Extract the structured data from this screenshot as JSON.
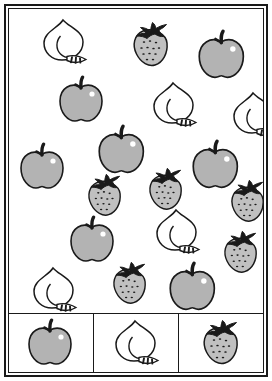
{
  "page": {
    "background_color": "#ffffff",
    "line_color": "#1a1a1a",
    "width": 272,
    "height": 381
  },
  "palette": {
    "apple_fill": "#b3b3b3",
    "apple_stem": "#1a1a1a",
    "apple_highlight": "#ffffff",
    "peach_fill": "#ffffff",
    "peach_outline": "#1a1a1a",
    "strawberry_fill": "#c0c0c0",
    "strawberry_leaf": "#1a1a1a",
    "strawberry_seed": "#1a1a1a",
    "outline": "#1a1a1a"
  },
  "scatter_panel": {
    "name": "fruit-scatter-area",
    "counts": {
      "apple": 7,
      "peach": 5,
      "strawberry": 6,
      "total": 18
    },
    "items": [
      {
        "kind": "peach",
        "x": 55,
        "y": 32,
        "scale": 1.0,
        "rotate": 0
      },
      {
        "kind": "strawberry",
        "x": 143,
        "y": 35,
        "scale": 1.0,
        "rotate": 0
      },
      {
        "kind": "apple",
        "x": 212,
        "y": 45,
        "scale": 1.05,
        "rotate": 0
      },
      {
        "kind": "apple",
        "x": 72,
        "y": 90,
        "scale": 1.0,
        "rotate": 0
      },
      {
        "kind": "peach",
        "x": 165,
        "y": 95,
        "scale": 1.0,
        "rotate": 0
      },
      {
        "kind": "peach",
        "x": 245,
        "y": 105,
        "scale": 1.0,
        "rotate": 0
      },
      {
        "kind": "apple",
        "x": 112,
        "y": 140,
        "scale": 1.05,
        "rotate": 0
      },
      {
        "kind": "apple",
        "x": 33,
        "y": 157,
        "scale": 1.0,
        "rotate": 0
      },
      {
        "kind": "apple",
        "x": 206,
        "y": 155,
        "scale": 1.05,
        "rotate": 0
      },
      {
        "kind": "strawberry",
        "x": 158,
        "y": 180,
        "scale": 0.95,
        "rotate": 0
      },
      {
        "kind": "strawberry",
        "x": 97,
        "y": 186,
        "scale": 0.95,
        "rotate": 0
      },
      {
        "kind": "strawberry",
        "x": 240,
        "y": 192,
        "scale": 0.95,
        "rotate": 0
      },
      {
        "kind": "apple",
        "x": 83,
        "y": 230,
        "scale": 1.0,
        "rotate": 0
      },
      {
        "kind": "peach",
        "x": 168,
        "y": 222,
        "scale": 1.0,
        "rotate": 0
      },
      {
        "kind": "strawberry",
        "x": 233,
        "y": 243,
        "scale": 0.95,
        "rotate": 0
      },
      {
        "kind": "peach",
        "x": 45,
        "y": 280,
        "scale": 1.0,
        "rotate": 0
      },
      {
        "kind": "strawberry",
        "x": 122,
        "y": 274,
        "scale": 0.95,
        "rotate": 0
      },
      {
        "kind": "apple",
        "x": 183,
        "y": 277,
        "scale": 1.05,
        "rotate": 0
      }
    ]
  },
  "legend": {
    "name": "fruit-key-row",
    "cells": [
      {
        "kind": "apple",
        "label": "apple"
      },
      {
        "kind": "peach",
        "label": "peach"
      },
      {
        "kind": "strawberry",
        "label": "strawberry"
      }
    ]
  }
}
